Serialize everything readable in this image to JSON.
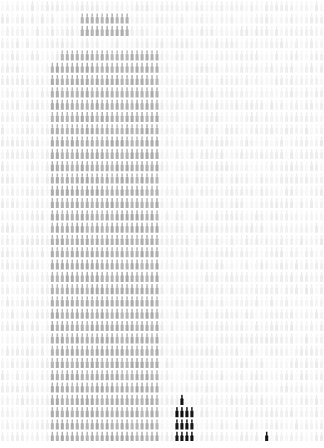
{
  "meta": {
    "title": "ASCII Glyph Mosaic",
    "width": 324,
    "height": 448
  },
  "canvas": {
    "background_color": "#ffffff",
    "columns": 65,
    "rows": 36,
    "cell_width": 5.0,
    "cell_height": 12.3,
    "glyph_name": "pin-bottle-glyph",
    "glyph_char": "╥"
  },
  "palette": {
    "background": "#f2f2f2",
    "paper": "#ffffff",
    "haze_light": "#efefef",
    "haze_mid": "#e8e8e8",
    "tower_gray": "#b4b4b4",
    "tower_gray_light": "#c2c2c2",
    "tower_dark": "#141414",
    "accent_dark": "#1a1a1a"
  },
  "chart_data": {
    "type": "heatmap",
    "xlabel": "",
    "ylabel": "",
    "legend": [],
    "grid": false,
    "columns": 65,
    "rows": 36,
    "value_scale": "0 = lightest background, 1 = darkest glyph",
    "regions": [
      {
        "name": "background-field",
        "shape": "rect",
        "x": 0,
        "y": 0,
        "w": 324,
        "h": 448,
        "value": 0.055,
        "color": "#efefef"
      },
      {
        "name": "skyscraper-crown",
        "shape": "rect",
        "x": 78,
        "y": 14,
        "w": 52,
        "h": 28,
        "value": 0.3,
        "color": "#b9b9b9"
      },
      {
        "name": "skyscraper-upper-setback",
        "shape": "rect",
        "x": 62,
        "y": 44,
        "w": 96,
        "h": 14,
        "value": 0.3,
        "color": "#b7b7b7"
      },
      {
        "name": "skyscraper-shaft",
        "shape": "rect",
        "x": 50,
        "y": 57,
        "w": 112,
        "h": 383,
        "value": 0.31,
        "color": "#b4b4b4"
      },
      {
        "name": "dark-spire-mast",
        "shape": "rect",
        "x": 177,
        "y": 388,
        "w": 6,
        "h": 15,
        "value": 0.93,
        "color": "#141414"
      },
      {
        "name": "dark-tower-body",
        "shape": "rect",
        "x": 172,
        "y": 403,
        "w": 21,
        "h": 37,
        "value": 0.93,
        "color": "#141414"
      },
      {
        "name": "right-marker-glyph",
        "shape": "rect",
        "x": 266,
        "y": 428,
        "w": 5,
        "h": 12,
        "value": 0.9,
        "color": "#1a1a1a"
      },
      {
        "name": "bottom-margin",
        "shape": "rect",
        "x": 0,
        "y": 441,
        "w": 324,
        "h": 7,
        "value": 0.0,
        "color": "#ffffff"
      }
    ]
  },
  "elements": {
    "mosaic_label": "glyph-mosaic-canvas",
    "skyline_label": "skyscraper-silhouette",
    "dark_tower_label": "dark-tower-silhouette",
    "marker_label": "right-marker-glyph"
  }
}
